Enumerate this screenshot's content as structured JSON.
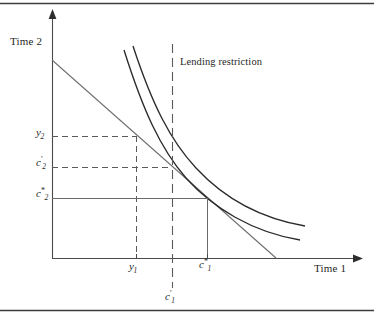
{
  "figure": {
    "kind": "intertemporal-choice-diagram",
    "axes": {
      "x_title": "Time 1",
      "y_title": "Time 2",
      "origin": {
        "x": 52,
        "y": 258
      },
      "x_end": {
        "x": 362,
        "y": 258
      },
      "y_top": {
        "x": 52,
        "y": 14
      }
    },
    "annotation": {
      "lending_restriction": "Lending restriction"
    },
    "y_ticks": [
      {
        "id": "y2",
        "text": "y",
        "sub": "2",
        "sup": "",
        "y": 136
      },
      {
        "id": "c2p",
        "text": "c",
        "sub": "2",
        "sup": "′",
        "y": 167
      },
      {
        "id": "c2star",
        "text": "c",
        "sub": "2",
        "sup": "*",
        "y": 198
      }
    ],
    "x_ticks": [
      {
        "id": "y1",
        "text": "y",
        "sub": "1",
        "sup": "",
        "x": 136
      },
      {
        "id": "c1star",
        "text": "c",
        "sub": "1",
        "sup": "*",
        "x": 207
      },
      {
        "id": "c1p",
        "text": "c",
        "sub": "1",
        "sup": "′",
        "x": 172
      }
    ],
    "colors": {
      "axis": "#4a4a4a",
      "budget_line": "#6e6e6e",
      "indifference_curve": "#2a2a2a",
      "restriction_line": "#5a5a5a",
      "guide_dashed": "#5a5a5a",
      "guide_solid": "#6a6a6a",
      "frame_rule": "#3d3d3d",
      "text": "#1f1f1f",
      "background": "#ffffff"
    },
    "geometry": {
      "budget_line": {
        "x1": 52,
        "y1": 60,
        "x2": 276,
        "y2": 258
      },
      "restriction_x": 172,
      "restriction_y_top": 44,
      "restriction_y_bottom": 288,
      "indifference_curve_outer": "M 133,46 C 152,104 170,140 196,168 C 222,196 258,218 305,226",
      "indifference_curve_inner": "M 124,50 C 143,110 160,148 186,178 C 213,208 252,232 300,240",
      "endowment_point": {
        "x": 136,
        "y": 136
      },
      "restricted_optimum": {
        "x": 172,
        "y": 167
      },
      "unrestricted_optimum": {
        "x": 207,
        "y": 198
      }
    },
    "frame": {
      "top_rule_y": 3,
      "bottom_rule_y": 310
    }
  }
}
